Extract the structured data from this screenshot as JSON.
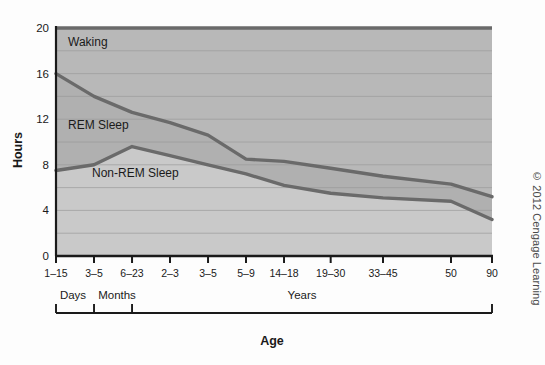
{
  "figure": {
    "axis_title_x": "Age",
    "axis_title_y": "Hours",
    "copyright": "© 2012 Cengage Learning"
  },
  "band_labels": {
    "waking": "Waking",
    "rem": "REM Sleep",
    "nonrem": "Non-REM Sleep"
  },
  "group_labels": {
    "days": "Days",
    "months": "Months",
    "years": "Years"
  },
  "colors": {
    "waking_band": "#b8b8b8",
    "rem_band": "#b0b0b0",
    "nonrem_band": "#c9c9c9",
    "curve": "#6a6a6a",
    "axis": "#1a1a1a",
    "gridline": "#9a9a9a",
    "text": "#1a1a1a",
    "copyright": "#4a4a4a",
    "page_background": "#fdfdfd"
  },
  "chart_data": {
    "type": "area",
    "title": "",
    "subtitle": "",
    "xlabel": "Age",
    "ylabel": "Hours",
    "ylim": [
      0,
      20
    ],
    "yticks": [
      0,
      4,
      8,
      12,
      16,
      20
    ],
    "ytick_labels": [
      "0",
      "4",
      "8",
      "12",
      "16",
      "20"
    ],
    "gridlines_y": [
      2,
      4,
      6,
      8,
      10,
      12,
      14,
      16,
      18,
      20
    ],
    "grid": true,
    "legend": "inline-band-labels",
    "categories": [
      "1–15",
      "3–5",
      "6–23",
      "2–3",
      "3–5",
      "5–9",
      "14–18",
      "19–30",
      "33–45",
      "50",
      "90"
    ],
    "xtick_labels": [
      "1–15",
      "3–5",
      "6–23",
      "2–3",
      "3–5",
      "5–9",
      "14–18",
      "19–30",
      "33–45",
      "50",
      "90"
    ],
    "x_group_brackets": [
      {
        "label": "Days",
        "from_category": "1–15",
        "to_category": "3–5"
      },
      {
        "label": "Months",
        "from_category": "3–5",
        "to_category": "6–23"
      },
      {
        "label": "Years",
        "from_category": "2–3",
        "to_category": "90"
      }
    ],
    "series": [
      {
        "name": "Non-REM Sleep",
        "description": "Lower boundary curve: hours of Non-REM sleep",
        "values": [
          7.5,
          8.0,
          9.6,
          8.8,
          8.0,
          7.2,
          6.2,
          5.5,
          5.1,
          4.8,
          3.2
        ]
      },
      {
        "name": "Total Sleep (REM + Non-REM)",
        "description": "Upper boundary curve: total sleep hours; area between curves is REM sleep",
        "values": [
          16.0,
          14.0,
          12.6,
          11.7,
          10.6,
          8.5,
          8.3,
          7.7,
          7.0,
          6.3,
          5.2
        ]
      },
      {
        "name": "Waking",
        "description": "Remaining hours of the 24-hour day above total sleep, up to 20 on this axis",
        "values": [
          20,
          20,
          20,
          20,
          20,
          20,
          20,
          20,
          20,
          20,
          20
        ]
      }
    ],
    "annotations": [
      {
        "text": "Waking",
        "x_category": "1–15",
        "y": 18.6
      },
      {
        "text": "REM Sleep",
        "x_category": "1–15",
        "y": 11.2
      },
      {
        "text": "Non-REM Sleep",
        "x_category": "3–5",
        "y": 7.0
      }
    ]
  }
}
